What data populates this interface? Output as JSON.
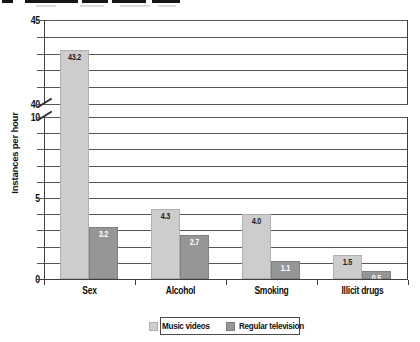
{
  "chart_data": {
    "type": "bar",
    "title": "",
    "ylabel": "Instances per hour",
    "xlabel": "",
    "categories": [
      "Sex",
      "Alcohol",
      "Smoking",
      "Illicit drugs"
    ],
    "series": [
      {
        "name": "Music videos",
        "color": "#cdcdcd",
        "label_color": "#1d1d1d",
        "values": [
          43.2,
          4.3,
          4.0,
          1.5
        ]
      },
      {
        "name": "Regular television",
        "color": "#969696",
        "label_color": "#ffffff",
        "values": [
          3.2,
          2.7,
          1.1,
          0.5
        ]
      }
    ],
    "axis": {
      "broken": true,
      "lower_range": [
        0,
        10
      ],
      "upper_range": [
        40,
        45
      ],
      "grid_step": 1,
      "labeled_ticks": [
        0,
        5,
        10,
        40,
        45
      ]
    },
    "grid": true,
    "legend_position": "bottom",
    "value_label_format": "one_decimal"
  }
}
